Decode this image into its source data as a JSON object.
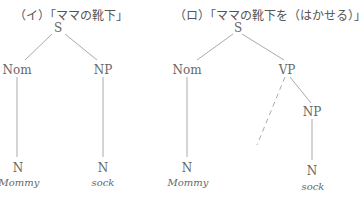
{
  "trees": [
    {
      "title": "（イ）「ママの靴下」",
      "nodes": {
        "root": "S",
        "left": "Nom",
        "right": "NP",
        "left_leaf_cat": "N",
        "right_leaf_cat": "N"
      },
      "words": {
        "left": "Mommy",
        "right": "sock"
      }
    },
    {
      "title": "（ロ）「ママの靴下を（はかせる）」",
      "nodes": {
        "root": "S",
        "left": "Nom",
        "right": "VP",
        "vp_child": "NP",
        "left_leaf_cat": "N",
        "right_leaf_cat": "N"
      },
      "words": {
        "left": "Mommy",
        "right": "sock"
      },
      "dashed_branch": "implied verb (empty)"
    }
  ],
  "colors": {
    "line": "#aaaaaa",
    "text": "#555555"
  }
}
